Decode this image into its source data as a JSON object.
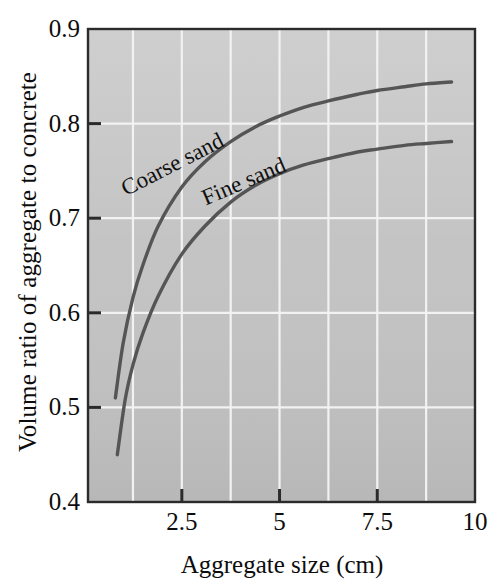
{
  "chart_data": {
    "type": "line",
    "title": "",
    "xlabel": "Aggregate size (cm)",
    "ylabel": "Volume ratio of aggregate to concrete",
    "xlim": [
      0.1,
      10
    ],
    "ylim": [
      0.4,
      0.9
    ],
    "xticks": [
      2.5,
      5,
      7.5,
      10
    ],
    "xtick_labels": [
      "2.5",
      "5",
      "7.5",
      "10"
    ],
    "yticks": [
      0.4,
      0.5,
      0.6,
      0.7,
      0.8,
      0.9
    ],
    "ytick_labels": [
      "0.4",
      "0.5",
      "0.6",
      "0.7",
      "0.8",
      "0.9"
    ],
    "grid": true,
    "grid_color": "#f2f2f2",
    "grid_x_values": [
      1.25,
      2.5,
      3.75,
      5,
      6.25,
      7.5,
      8.75
    ],
    "grid_y_values": [
      0.5,
      0.6,
      0.7,
      0.8
    ],
    "plot_background": "#c3c3c3",
    "axis_color": "#2b2b2b",
    "legend_position": "inline-curve-labels",
    "series": [
      {
        "name": "Coarse sand",
        "color": "#555555",
        "label_text": "Coarse sand",
        "x": [
          0.8,
          1.0,
          1.25,
          1.5,
          1.9,
          2.5,
          3.1,
          3.75,
          4.4,
          5.0,
          5.6,
          6.25,
          7.0,
          7.5,
          8.2,
          8.75,
          9.4
        ],
        "y": [
          0.51,
          0.568,
          0.616,
          0.65,
          0.692,
          0.733,
          0.76,
          0.781,
          0.797,
          0.808,
          0.817,
          0.824,
          0.831,
          0.835,
          0.839,
          0.842,
          0.844
        ]
      },
      {
        "name": "Fine sand",
        "color": "#555555",
        "label_text": "Fine sand",
        "x": [
          0.85,
          1.05,
          1.25,
          1.5,
          1.9,
          2.5,
          3.1,
          3.75,
          4.4,
          5.0,
          5.6,
          6.25,
          7.0,
          7.5,
          8.2,
          8.75,
          9.4
        ],
        "y": [
          0.45,
          0.508,
          0.545,
          0.578,
          0.618,
          0.662,
          0.692,
          0.717,
          0.735,
          0.747,
          0.756,
          0.763,
          0.77,
          0.773,
          0.777,
          0.779,
          0.781
        ]
      }
    ]
  }
}
